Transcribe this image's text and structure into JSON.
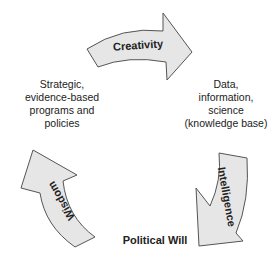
{
  "arrows": {
    "top": {
      "label": "Creativity"
    },
    "right": {
      "label": "Intelligence"
    },
    "left": {
      "label": "Wisdom"
    }
  },
  "nodes": {
    "left": {
      "lines": [
        "Strategic,",
        "evidence-based",
        "programs and",
        "policies"
      ]
    },
    "right": {
      "lines": [
        "Data,",
        "information,",
        "science",
        "(knowledge base)"
      ]
    },
    "bottom": {
      "label": "Political Will"
    }
  },
  "colors": {
    "arrow_fill": "#e6e6e6",
    "arrow_stroke": "#555555",
    "text": "#222222"
  }
}
